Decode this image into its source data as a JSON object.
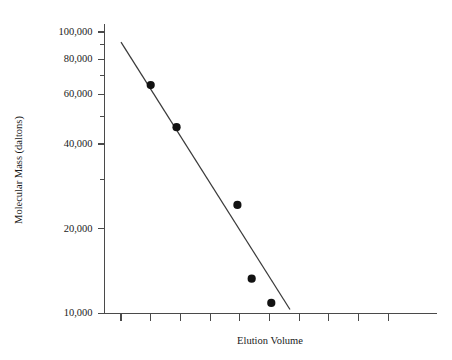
{
  "chart_data": {
    "type": "scatter",
    "title": "",
    "xlabel": "Elution Volume",
    "ylabel": "Molecular Mass (daltons)",
    "yscale": "log",
    "ylim": [
      10000,
      100000
    ],
    "y_tick_labels": [
      "100,000",
      "80,000",
      "60,000",
      "40,000",
      "20,000",
      "10,000"
    ],
    "y_labeled_ticks": [
      100000,
      80000,
      60000,
      40000,
      20000,
      10000
    ],
    "y_minor_ticks": [
      90000,
      70000,
      50000,
      30000
    ],
    "x_tick_count": 10,
    "x_tick_labels": [],
    "grid": false,
    "legend": null,
    "series": [
      {
        "name": "protein standards",
        "marker": "filled-circle",
        "color": "#121212",
        "points": [
          {
            "x": 1.0,
            "y": 64800
          },
          {
            "x": 1.87,
            "y": 45900
          },
          {
            "x": 3.92,
            "y": 24300
          },
          {
            "x": 4.4,
            "y": 13300
          },
          {
            "x": 5.06,
            "y": 10900
          }
        ]
      }
    ],
    "fit_line": {
      "name": "calibration line",
      "color": "#3a3a3a",
      "x_start": 0.0,
      "y_start": 92000,
      "x_end": 5.69,
      "y_end": 10330
    }
  },
  "axes": {
    "y_title": "Molecular Mass (daltons)",
    "x_title": "Elution Volume"
  }
}
